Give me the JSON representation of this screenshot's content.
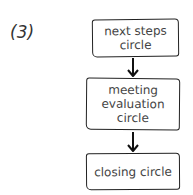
{
  "diagram": {
    "label": "(3)",
    "type": "flowchart",
    "nodes": [
      {
        "id": "n1",
        "text": "next steps circle",
        "lines": [
          "next steps",
          "circle"
        ]
      },
      {
        "id": "n2",
        "text": "meeting evaluation circle",
        "lines": [
          "meeting",
          "evaluation",
          "circle"
        ]
      },
      {
        "id": "n3",
        "text": "closing circle",
        "lines": [
          "closing circle"
        ]
      }
    ],
    "edges": [
      {
        "from": "n1",
        "to": "n2"
      },
      {
        "from": "n2",
        "to": "n3"
      }
    ],
    "colors": {
      "stroke": "#222222",
      "text": "#444444"
    }
  }
}
